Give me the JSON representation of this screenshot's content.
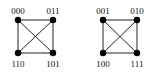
{
  "diagram": {
    "type": "graph",
    "colors": {
      "edge": "#222222",
      "node": "#000000",
      "label": "#111111",
      "background": "#ffffff"
    },
    "graphs": [
      {
        "name": "left",
        "nodes": [
          {
            "id": "000",
            "label": "000",
            "x": 18,
            "y": 20,
            "label_pos": "above"
          },
          {
            "id": "011",
            "label": "011",
            "x": 53,
            "y": 20,
            "label_pos": "above"
          },
          {
            "id": "110",
            "label": "110",
            "x": 18,
            "y": 53,
            "label_pos": "below"
          },
          {
            "id": "101",
            "label": "101",
            "x": 53,
            "y": 53,
            "label_pos": "below"
          }
        ],
        "edges": [
          [
            "000",
            "011"
          ],
          [
            "000",
            "110"
          ],
          [
            "011",
            "101"
          ],
          [
            "110",
            "101"
          ],
          [
            "000",
            "101"
          ],
          [
            "011",
            "110"
          ]
        ]
      },
      {
        "name": "right",
        "nodes": [
          {
            "id": "001",
            "label": "001",
            "x": 103,
            "y": 20,
            "label_pos": "above"
          },
          {
            "id": "010",
            "label": "010",
            "x": 137,
            "y": 20,
            "label_pos": "above"
          },
          {
            "id": "100",
            "label": "100",
            "x": 103,
            "y": 53,
            "label_pos": "below"
          },
          {
            "id": "111",
            "label": "111",
            "x": 137,
            "y": 53,
            "label_pos": "below"
          }
        ],
        "edges": [
          [
            "001",
            "010"
          ],
          [
            "001",
            "100"
          ],
          [
            "010",
            "111"
          ],
          [
            "100",
            "111"
          ],
          [
            "001",
            "111"
          ],
          [
            "010",
            "100"
          ]
        ]
      }
    ]
  }
}
